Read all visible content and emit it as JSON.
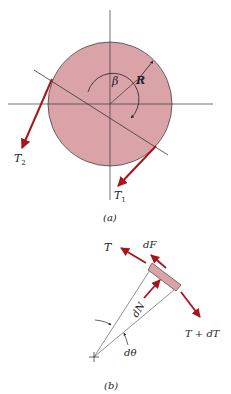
{
  "figure_a": {
    "caption": "(a)",
    "labels": {
      "beta": "β",
      "radius": "R",
      "t2": "T",
      "t2_sub": "2",
      "t1": "T",
      "t1_sub": "1"
    }
  },
  "figure_b": {
    "caption": "(b)",
    "labels": {
      "tension": "T",
      "friction": "dF",
      "normal": "dN",
      "tension_plus": "T + dT",
      "angle": "dθ"
    }
  },
  "colors": {
    "disk_fill": "#d9a3a8",
    "force_arrow": "#a8141c",
    "line": "#333333"
  }
}
